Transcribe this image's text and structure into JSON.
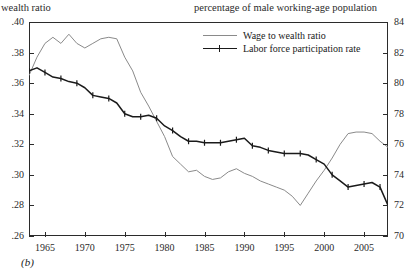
{
  "header": {
    "left_label": "wealth ratio",
    "right_label": "percentage of male working-age population"
  },
  "caption": "(b)",
  "legend": {
    "items": [
      {
        "label": "Wage to wealth ratio",
        "color": "#8a8a8a",
        "marker": "none"
      },
      {
        "label": "Labor force participation rate",
        "color": "#1a1a1a",
        "marker": "cross"
      }
    ]
  },
  "chart_data": {
    "type": "line",
    "title": "",
    "xlabel": "",
    "ylabel": "wealth ratio",
    "y2label": "percentage of male working-age population",
    "grid": false,
    "legend_position": "top-center",
    "xlim": [
      1963,
      2008
    ],
    "ylim": [
      0.26,
      0.4
    ],
    "y2lim": [
      70,
      84
    ],
    "xticks": [
      1965,
      1970,
      1975,
      1980,
      1985,
      1990,
      1995,
      2000,
      2005
    ],
    "yticks": [
      0.26,
      0.28,
      0.3,
      0.32,
      0.34,
      0.36,
      0.38,
      0.4
    ],
    "ytick_labels": [
      ".26",
      ".28",
      ".30",
      ".32",
      ".34",
      ".36",
      ".38",
      ".40"
    ],
    "y2ticks": [
      70,
      72,
      74,
      76,
      78,
      80,
      82,
      84
    ],
    "y2tick_labels": [
      "70",
      "72",
      "74",
      "76",
      "78",
      "80",
      "82",
      "84"
    ],
    "series": [
      {
        "name": "Wage to wealth ratio",
        "axis": "left",
        "color": "#8a8a8a",
        "x": [
          1963,
          1964,
          1965,
          1966,
          1967,
          1968,
          1969,
          1970,
          1971,
          1972,
          1973,
          1974,
          1975,
          1976,
          1977,
          1978,
          1979,
          1980,
          1981,
          1982,
          1983,
          1984,
          1985,
          1986,
          1987,
          1988,
          1989,
          1990,
          1991,
          1992,
          1993,
          1994,
          1995,
          1996,
          1997,
          1998,
          1999,
          2000,
          2001,
          2002,
          2003,
          2004,
          2005,
          2006,
          2007,
          2008
        ],
        "values": [
          0.365,
          0.377,
          0.386,
          0.39,
          0.386,
          0.392,
          0.386,
          0.383,
          0.386,
          0.389,
          0.39,
          0.389,
          0.377,
          0.368,
          0.354,
          0.345,
          0.335,
          0.325,
          0.312,
          0.307,
          0.302,
          0.303,
          0.299,
          0.297,
          0.298,
          0.302,
          0.304,
          0.301,
          0.299,
          0.296,
          0.294,
          0.292,
          0.29,
          0.286,
          0.28,
          0.288,
          0.296,
          0.303,
          0.311,
          0.32,
          0.327,
          0.328,
          0.328,
          0.327,
          0.322,
          0.318
        ]
      },
      {
        "name": "Labor force participation rate",
        "axis": "right",
        "color": "#1a1a1a",
        "marker": "cross",
        "x": [
          1963,
          1964,
          1965,
          1966,
          1967,
          1968,
          1969,
          1970,
          1971,
          1972,
          1973,
          1974,
          1975,
          1976,
          1977,
          1978,
          1979,
          1980,
          1981,
          1982,
          1983,
          1984,
          1985,
          1986,
          1987,
          1988,
          1989,
          1990,
          1991,
          1992,
          1993,
          1994,
          1995,
          1996,
          1997,
          1998,
          1999,
          2000,
          2001,
          2002,
          2003,
          2004,
          2005,
          2006,
          2007,
          2008
        ],
        "values": [
          80.8,
          81.0,
          80.7,
          80.4,
          80.3,
          80.1,
          80.0,
          79.7,
          79.2,
          79.1,
          79.0,
          78.7,
          78.0,
          77.8,
          77.8,
          77.9,
          77.7,
          77.2,
          76.9,
          76.5,
          76.2,
          76.2,
          76.1,
          76.1,
          76.1,
          76.2,
          76.3,
          76.4,
          75.9,
          75.8,
          75.6,
          75.5,
          75.4,
          75.4,
          75.4,
          75.3,
          75.0,
          74.7,
          74.0,
          73.6,
          73.2,
          73.3,
          73.4,
          73.5,
          73.2,
          72.0
        ]
      }
    ]
  }
}
